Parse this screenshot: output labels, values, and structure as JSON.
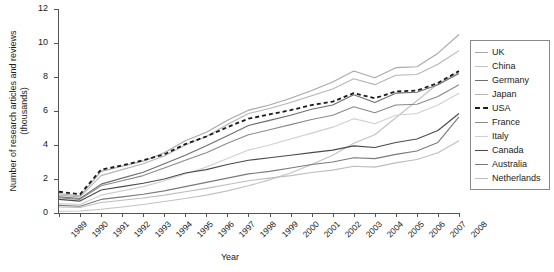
{
  "chart_data": {
    "type": "line",
    "title": "",
    "xlabel": "Year",
    "ylabel": "Number of research articles and reviews (thousands)",
    "grid": false,
    "legend_position": "right",
    "xlim": [
      1989,
      2008
    ],
    "ylim": [
      0,
      12
    ],
    "yticks": [
      0,
      2,
      4,
      6,
      8,
      10,
      12
    ],
    "categories": [
      1989,
      1990,
      1991,
      1992,
      1993,
      1994,
      1995,
      1996,
      1997,
      1998,
      1999,
      2000,
      2001,
      2002,
      2003,
      2004,
      2005,
      2006,
      2007,
      2008
    ],
    "x": [
      "1989",
      "1990",
      "1991",
      "1992",
      "1993",
      "1994",
      "1995",
      "1996",
      "1997",
      "1998",
      "1999",
      "2000",
      "2001",
      "2002",
      "2003",
      "2004",
      "2005",
      "2006",
      "2007",
      "2008"
    ],
    "series": [
      {
        "name": "UK",
        "color": "#a8a8a8",
        "dash": "none",
        "values": [
          1.15,
          1.0,
          2.45,
          2.75,
          3.05,
          3.55,
          4.25,
          4.75,
          5.45,
          6.05,
          6.35,
          6.75,
          7.2,
          7.7,
          8.35,
          7.95,
          8.55,
          8.6,
          9.4,
          10.5
        ]
      },
      {
        "name": "China",
        "color": "#c2c2c2",
        "dash": "none",
        "values": [
          0.1,
          0.12,
          0.22,
          0.35,
          0.5,
          0.68,
          0.85,
          1.05,
          1.3,
          1.6,
          1.95,
          2.35,
          2.85,
          3.4,
          4.1,
          4.6,
          5.6,
          6.6,
          7.6,
          8.3
        ]
      },
      {
        "name": "Germany",
        "color": "#6e6e6e",
        "dash": "none",
        "values": [
          0.95,
          0.85,
          1.7,
          2.05,
          2.4,
          2.9,
          3.4,
          3.95,
          4.55,
          5.15,
          5.45,
          5.75,
          6.1,
          6.35,
          6.95,
          6.5,
          7.05,
          7.1,
          7.55,
          8.2
        ]
      },
      {
        "name": "Japan",
        "color": "#b5b5b5",
        "dash": "none",
        "values": [
          1.05,
          0.95,
          2.2,
          2.55,
          2.9,
          3.35,
          4.0,
          4.5,
          5.2,
          5.85,
          6.15,
          6.5,
          6.9,
          7.3,
          7.9,
          7.55,
          8.1,
          8.15,
          8.75,
          9.55
        ]
      },
      {
        "name": "USA",
        "color": "#1a1a1a",
        "dash": "4 3",
        "values": [
          1.25,
          1.1,
          2.55,
          2.8,
          3.1,
          3.45,
          4.05,
          4.5,
          5.05,
          5.55,
          5.8,
          6.05,
          6.35,
          6.55,
          7.05,
          6.75,
          7.15,
          7.2,
          7.65,
          8.35
        ]
      },
      {
        "name": "France",
        "color": "#8a8a8a",
        "dash": "none",
        "values": [
          0.9,
          0.8,
          1.6,
          1.9,
          2.2,
          2.65,
          3.1,
          3.55,
          4.1,
          4.6,
          4.9,
          5.2,
          5.5,
          5.75,
          6.25,
          5.9,
          6.35,
          6.4,
          6.85,
          7.55
        ]
      },
      {
        "name": "Italy",
        "color": "#cfcfcf",
        "dash": "none",
        "values": [
          0.55,
          0.5,
          1.05,
          1.3,
          1.55,
          1.9,
          2.3,
          2.7,
          3.2,
          3.7,
          4.0,
          4.35,
          4.7,
          5.05,
          5.55,
          5.25,
          5.75,
          5.85,
          6.35,
          7.05
        ]
      },
      {
        "name": "Canada",
        "color": "#4a4a4a",
        "dash": "none",
        "values": [
          0.8,
          0.7,
          1.35,
          1.55,
          1.75,
          2.0,
          2.35,
          2.55,
          2.85,
          3.1,
          3.25,
          3.4,
          3.55,
          3.7,
          3.95,
          3.85,
          4.15,
          4.35,
          4.85,
          5.85
        ]
      },
      {
        "name": "Australia",
        "color": "#7a7a7a",
        "dash": "none",
        "values": [
          0.45,
          0.4,
          0.8,
          0.95,
          1.1,
          1.3,
          1.55,
          1.8,
          2.05,
          2.3,
          2.45,
          2.65,
          2.85,
          3.0,
          3.25,
          3.2,
          3.45,
          3.65,
          4.15,
          5.65
        ]
      },
      {
        "name": "Netherlands",
        "color": "#bdbdbd",
        "dash": "none",
        "values": [
          0.35,
          0.32,
          0.62,
          0.75,
          0.88,
          1.05,
          1.25,
          1.45,
          1.68,
          1.9,
          2.05,
          2.2,
          2.38,
          2.52,
          2.75,
          2.7,
          2.95,
          3.15,
          3.55,
          4.25
        ]
      }
    ]
  },
  "axes": {
    "ylabel": "Number of research articles and reviews (thousands)",
    "xlabel": "Year"
  }
}
